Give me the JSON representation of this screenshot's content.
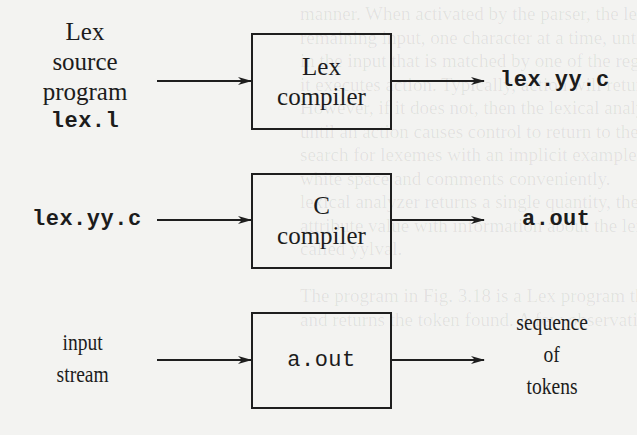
{
  "diagram": {
    "stages": [
      {
        "input": {
          "lines": [
            "Lex",
            "source",
            "program"
          ],
          "file": "lex.l"
        },
        "process": {
          "lines": [
            "Lex",
            "compiler"
          ]
        },
        "output": {
          "file": "lex.yy.c"
        }
      },
      {
        "input": {
          "file": "lex.yy.c"
        },
        "process": {
          "lines": [
            "C",
            "compiler"
          ]
        },
        "output": {
          "file": "a.out"
        }
      },
      {
        "input": {
          "lines": [
            "input",
            "stream"
          ]
        },
        "process": {
          "file": "a.out"
        },
        "output": {
          "lines": [
            "sequence",
            "of",
            "tokens"
          ]
        }
      }
    ],
    "edges": [
      {
        "from": "Lex source program lex.l",
        "to": "Lex compiler"
      },
      {
        "from": "Lex compiler",
        "to": "lex.yy.c"
      },
      {
        "from": "lex.yy.c",
        "to": "C compiler"
      },
      {
        "from": "C compiler",
        "to": "a.out"
      },
      {
        "from": "input stream",
        "to": "a.out"
      },
      {
        "from": "a.out",
        "to": "sequence of tokens"
      }
    ],
    "colors": {
      "background": "#f3f3f1",
      "ink": "#1c1c1c"
    }
  },
  "background_text": "manner. When activated by the parser, the lexical analyzer\nremaining input, one character at a time, until it has\nin the input that is matched by one of the regular\nit executes action. Typically, action will return control\nHowever, if it does not, then the lexical analyzer proceeds\nuntil an action causes control to return to the parser.\nsearch for lexemes with an implicit example in the lexical\nwhite space and comments conveniently.\nlexical analyzer returns a single quantity, the token, to the\nattribute value with information about the lexeme, we can\ncalled yylval.\n\nThe program in Fig. 3.18 is a Lex program that recognizes the\nand returns the token found. A few observations about the"
}
